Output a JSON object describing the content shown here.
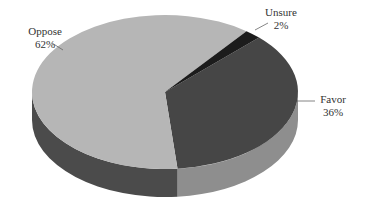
{
  "chart_data": {
    "type": "pie",
    "style": "3d",
    "title": "",
    "categories": [
      "Favor",
      "Unsure",
      "Oppose"
    ],
    "values": [
      36,
      2,
      62
    ],
    "labels": [
      "Favor\n36%",
      "Unsure\n2%",
      "Oppose\n62%"
    ],
    "colors": {
      "Favor": {
        "top": "#464646",
        "side": "#8e8e8e"
      },
      "Unsure": {
        "top": "#1c1c1c",
        "side": "#1c1c1c"
      },
      "Oppose": {
        "top": "#b6b6b6",
        "side": "#4b4b4b"
      }
    },
    "legend": "none (callout labels)"
  },
  "labels": {
    "oppose": {
      "name": "Oppose",
      "pct": "62%"
    },
    "unsure": {
      "name": "Unsure",
      "pct": "2%"
    },
    "favor": {
      "name": "Favor",
      "pct": "36%"
    }
  }
}
